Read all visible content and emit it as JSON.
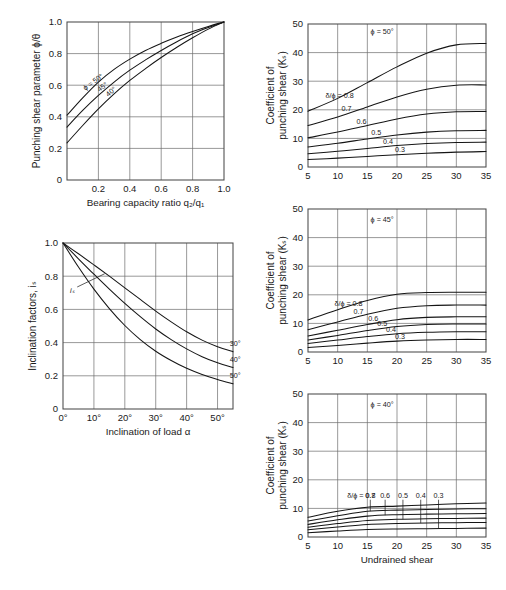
{
  "figure": {
    "title": "",
    "background": "#ffffff",
    "ink": "#151515"
  },
  "chart_data": [
    {
      "id": "punching-shear-parameter",
      "type": "line",
      "title": "",
      "xlabel": "Bearing capacity ratio q₂/q₁",
      "ylabel": "Punching shear parameter ϕ/θ",
      "xlim": [
        0,
        1.0
      ],
      "ylim": [
        0,
        1.0
      ],
      "xticks": [
        "0.2",
        "0.4",
        "0.6",
        "0.8",
        "1.0"
      ],
      "xtickvals": [
        0.2,
        0.4,
        0.6,
        0.8,
        1.0
      ],
      "yticks": [
        "0",
        "0.2",
        "0.4",
        "0.6",
        "0.8",
        "1.0"
      ],
      "ytickvals": [
        0,
        0.2,
        0.4,
        0.6,
        0.8,
        1.0
      ],
      "grid": true,
      "legend_position": "inline-on-curve",
      "series": [
        {
          "name": "ϕ = 50°",
          "label": "ϕ = 50°",
          "x": [
            0.0,
            0.1,
            0.2,
            0.3,
            0.4,
            0.5,
            0.6,
            0.7,
            0.8,
            0.9,
            1.0
          ],
          "values": [
            0.41,
            0.52,
            0.62,
            0.7,
            0.765,
            0.82,
            0.865,
            0.905,
            0.94,
            0.972,
            1.0
          ]
        },
        {
          "name": "45°",
          "label": "45°",
          "x": [
            0.0,
            0.1,
            0.2,
            0.3,
            0.4,
            0.5,
            0.6,
            0.7,
            0.8,
            0.9,
            1.0
          ],
          "values": [
            0.335,
            0.44,
            0.535,
            0.62,
            0.695,
            0.76,
            0.82,
            0.875,
            0.925,
            0.965,
            1.0
          ]
        },
        {
          "name": "40°",
          "label": "40°",
          "x": [
            0.0,
            0.1,
            0.2,
            0.3,
            0.4,
            0.5,
            0.6,
            0.7,
            0.8,
            0.9,
            1.0
          ],
          "values": [
            0.235,
            0.345,
            0.45,
            0.545,
            0.63,
            0.705,
            0.775,
            0.84,
            0.9,
            0.955,
            1.0
          ]
        }
      ]
    },
    {
      "id": "inclination-factors",
      "type": "line",
      "title": "",
      "xlabel": "Inclination of load α",
      "ylabel": "Inclination factors, iₛ",
      "annotation": "iₛ",
      "xlim": [
        0,
        55
      ],
      "ylim": [
        0,
        1.0
      ],
      "xticks": [
        "0°",
        "10°",
        "20°",
        "30°",
        "40°",
        "50°"
      ],
      "xtickvals": [
        0,
        10,
        20,
        30,
        40,
        50
      ],
      "yticks": [
        "0",
        "0.2",
        "0.4",
        "0.6",
        "0.8",
        "1.0"
      ],
      "ytickvals": [
        0,
        0.2,
        0.4,
        0.6,
        0.8,
        1.0
      ],
      "grid": true,
      "legend_position": "right-end-of-curve",
      "series": [
        {
          "name": "30°",
          "label": "30°",
          "x": [
            0,
            5,
            10,
            15,
            20,
            25,
            30,
            35,
            40,
            45,
            50,
            55
          ],
          "values": [
            1.0,
            0.935,
            0.868,
            0.8,
            0.73,
            0.66,
            0.59,
            0.525,
            0.465,
            0.415,
            0.375,
            0.345
          ]
        },
        {
          "name": "40°",
          "label": "40°",
          "x": [
            0,
            5,
            10,
            15,
            20,
            25,
            30,
            35,
            40,
            45,
            50,
            55
          ],
          "values": [
            1.0,
            0.905,
            0.812,
            0.722,
            0.636,
            0.556,
            0.482,
            0.418,
            0.362,
            0.315,
            0.278,
            0.25
          ]
        },
        {
          "name": "50°",
          "label": "50°",
          "x": [
            0,
            5,
            10,
            15,
            20,
            25,
            30,
            35,
            40,
            45,
            50,
            55
          ],
          "values": [
            1.0,
            0.855,
            0.722,
            0.605,
            0.503,
            0.418,
            0.348,
            0.292,
            0.245,
            0.208,
            0.178,
            0.152
          ]
        }
      ]
    },
    {
      "id": "punching-shear-coefficient-phi-50",
      "type": "line",
      "title": "ϕ = 50°",
      "xlabel": "",
      "ylabel": "Coefficient of punching shear (Kₛ)",
      "xlim": [
        5,
        35
      ],
      "ylim": [
        0,
        50
      ],
      "xticks": [
        "5",
        "10",
        "15",
        "20",
        "25",
        "30",
        "35"
      ],
      "xtickvals": [
        5,
        10,
        15,
        20,
        25,
        30,
        35
      ],
      "yticks": [
        "0",
        "10",
        "20",
        "30",
        "40",
        "50"
      ],
      "ytickvals": [
        0,
        10,
        20,
        30,
        40,
        50
      ],
      "grid": true,
      "legend_label": "δ/ϕ = 0.8",
      "legend_position": "inline-left",
      "series": [
        {
          "name": "0.8",
          "label": "δ/ϕ = 0.8",
          "x": [
            5,
            10,
            15,
            20,
            25,
            30,
            35
          ],
          "values": [
            19.5,
            24.0,
            29.5,
            35.0,
            39.8,
            42.7,
            43.2
          ]
        },
        {
          "name": "0.7",
          "label": "0.7",
          "x": [
            5,
            10,
            15,
            20,
            25,
            30,
            35
          ],
          "values": [
            14.5,
            17.5,
            21.0,
            24.5,
            27.2,
            28.6,
            28.7
          ]
        },
        {
          "name": "0.6",
          "label": "0.6",
          "x": [
            5,
            10,
            15,
            20,
            25,
            30,
            35
          ],
          "values": [
            10.2,
            12.2,
            14.5,
            16.8,
            18.5,
            19.3,
            19.4
          ]
        },
        {
          "name": "0.5",
          "label": "0.5",
          "x": [
            5,
            10,
            15,
            20,
            25,
            30,
            35
          ],
          "values": [
            7.0,
            8.3,
            9.8,
            11.2,
            12.2,
            12.7,
            12.8
          ]
        },
        {
          "name": "0.4",
          "label": "0.4",
          "x": [
            5,
            10,
            15,
            20,
            25,
            30,
            35
          ],
          "values": [
            4.6,
            5.5,
            6.5,
            7.5,
            8.2,
            8.6,
            8.7
          ]
        },
        {
          "name": "0.3",
          "label": "0.3",
          "x": [
            5,
            10,
            15,
            20,
            25,
            30,
            35
          ],
          "values": [
            2.6,
            3.1,
            3.7,
            4.3,
            4.8,
            5.2,
            5.4
          ]
        }
      ]
    },
    {
      "id": "punching-shear-coefficient-phi-45",
      "type": "line",
      "title": "ϕ = 45°",
      "xlabel": "",
      "ylabel": "Coefficient of punching shear (Kₛ)",
      "xlim": [
        5,
        35
      ],
      "ylim": [
        0,
        50
      ],
      "xticks": [
        "5",
        "10",
        "15",
        "20",
        "25",
        "30",
        "35"
      ],
      "xtickvals": [
        5,
        10,
        15,
        20,
        25,
        30,
        35
      ],
      "yticks": [
        "0",
        "10",
        "20",
        "30",
        "40",
        "50"
      ],
      "ytickvals": [
        0,
        10,
        20,
        30,
        40,
        50
      ],
      "grid": true,
      "legend_label": "δ/ϕ = 0.8",
      "legend_position": "inline-left",
      "series": [
        {
          "name": "0.8",
          "label": "δ/ϕ = 0.8",
          "x": [
            5,
            10,
            15,
            20,
            25,
            30,
            35
          ],
          "values": [
            11.2,
            14.8,
            18.0,
            20.2,
            20.8,
            20.9,
            20.9
          ]
        },
        {
          "name": "0.7",
          "label": "0.7",
          "x": [
            5,
            10,
            15,
            20,
            25,
            30,
            35
          ],
          "values": [
            7.8,
            10.5,
            13.2,
            15.3,
            16.2,
            16.4,
            16.4
          ]
        },
        {
          "name": "0.6",
          "label": "0.6",
          "x": [
            5,
            10,
            15,
            20,
            25,
            30,
            35
          ],
          "values": [
            5.6,
            7.6,
            9.6,
            11.3,
            12.1,
            12.3,
            12.3
          ]
        },
        {
          "name": "0.5",
          "label": "0.5",
          "x": [
            5,
            10,
            15,
            20,
            25,
            30,
            35
          ],
          "values": [
            4.2,
            5.8,
            7.5,
            8.9,
            9.6,
            9.8,
            9.8
          ]
        },
        {
          "name": "0.4",
          "label": "0.4",
          "x": [
            5,
            10,
            15,
            20,
            25,
            30,
            35
          ],
          "values": [
            3.0,
            4.2,
            5.4,
            6.4,
            6.9,
            7.1,
            7.1
          ]
        },
        {
          "name": "0.3",
          "label": "0.3",
          "x": [
            5,
            10,
            15,
            20,
            25,
            30,
            35
          ],
          "values": [
            1.6,
            2.3,
            3.1,
            3.8,
            4.2,
            4.4,
            4.4
          ]
        }
      ]
    },
    {
      "id": "punching-shear-coefficient-phi-40",
      "type": "line",
      "title": "ϕ = 40°",
      "xlabel": "Undrained shear",
      "ylabel": "Coefficient of punching shear (Kₛ)",
      "xlim": [
        5,
        35
      ],
      "ylim": [
        0,
        50
      ],
      "xticks": [
        "5",
        "10",
        "15",
        "20",
        "25",
        "30",
        "35"
      ],
      "xtickvals": [
        5,
        10,
        15,
        20,
        25,
        30,
        35
      ],
      "yticks": [
        "0",
        "10",
        "20",
        "30",
        "40",
        "50"
      ],
      "ytickvals": [
        0,
        10,
        20,
        30,
        40,
        50
      ],
      "grid": true,
      "legend_label": "δ/ϕ = 0.8",
      "legend_position": "inline-with-leaders",
      "series": [
        {
          "name": "0.8",
          "label": "δ/ϕ = 0.8",
          "x": [
            5,
            10,
            15,
            20,
            25,
            30,
            35
          ],
          "values": [
            6.9,
            9.0,
            10.4,
            10.8,
            11.2,
            11.6,
            11.9
          ]
        },
        {
          "name": "0.7",
          "label": "0.7",
          "x": [
            5,
            10,
            15,
            20,
            25,
            30,
            35
          ],
          "values": [
            5.6,
            7.4,
            9.0,
            9.4,
            9.6,
            9.8,
            9.9
          ]
        },
        {
          "name": "0.6",
          "label": "0.6",
          "x": [
            5,
            10,
            15,
            20,
            25,
            30,
            35
          ],
          "values": [
            4.4,
            6.0,
            7.3,
            7.8,
            8.0,
            8.1,
            8.2
          ]
        },
        {
          "name": "0.5",
          "label": "0.5",
          "x": [
            5,
            10,
            15,
            20,
            25,
            30,
            35
          ],
          "values": [
            3.4,
            4.7,
            5.8,
            6.2,
            6.4,
            6.5,
            6.6
          ]
        },
        {
          "name": "0.4",
          "label": "0.4",
          "x": [
            5,
            10,
            15,
            20,
            25,
            30,
            35
          ],
          "values": [
            2.5,
            3.5,
            4.4,
            4.7,
            4.9,
            5.0,
            5.1
          ]
        },
        {
          "name": "0.3",
          "label": "0.3",
          "x": [
            5,
            10,
            15,
            20,
            25,
            30,
            35
          ],
          "values": [
            1.5,
            2.1,
            2.6,
            2.8,
            2.9,
            3.0,
            3.1
          ]
        }
      ]
    }
  ]
}
